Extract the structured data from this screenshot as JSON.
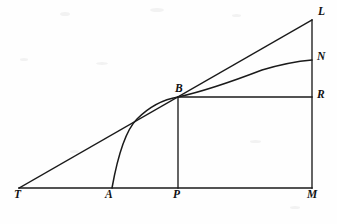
{
  "figure": {
    "kind": "geometry-diagram",
    "width": 337,
    "height": 224,
    "background_color": "#fefefe",
    "stroke_color": "#1a1a1a",
    "labels": [
      {
        "id": "label-T",
        "text": "T",
        "x": 14,
        "y": 189
      },
      {
        "id": "label-A",
        "text": "A",
        "x": 105,
        "y": 189
      },
      {
        "id": "label-P",
        "text": "P",
        "x": 173,
        "y": 189
      },
      {
        "id": "label-M",
        "text": "M",
        "x": 307,
        "y": 189
      },
      {
        "id": "label-B",
        "text": "B",
        "x": 175,
        "y": 83
      },
      {
        "id": "label-R",
        "text": "R",
        "x": 317,
        "y": 89
      },
      {
        "id": "label-N",
        "text": "N",
        "x": 317,
        "y": 51
      },
      {
        "id": "label-L",
        "text": "L",
        "x": 318,
        "y": 6
      }
    ],
    "points": {
      "T": {
        "x": 19,
        "y": 188
      },
      "A": {
        "x": 112,
        "y": 188
      },
      "P": {
        "x": 178,
        "y": 188
      },
      "M": {
        "x": 312,
        "y": 188
      },
      "B": {
        "x": 178,
        "y": 97
      },
      "R": {
        "x": 312,
        "y": 97
      },
      "N": {
        "x": 312,
        "y": 60
      },
      "L": {
        "x": 312,
        "y": 20
      }
    },
    "segments": [
      {
        "id": "baseline-TM",
        "name": "baseline-tm",
        "from": "T",
        "to": "M"
      },
      {
        "id": "tangent-TL",
        "name": "tangent-line-tl",
        "from": "T",
        "to": "L"
      },
      {
        "id": "vertical-PB",
        "name": "vertical-pb",
        "from": "P",
        "to": "B"
      },
      {
        "id": "vertical-ML",
        "name": "vertical-ml",
        "from": "M",
        "to": "L"
      },
      {
        "id": "horizontal-BR",
        "name": "horizontal-br",
        "from": "B",
        "to": "R"
      }
    ],
    "curve": {
      "id": "curve-ABN",
      "name": "logarithmic-curve-abn",
      "through": [
        "A",
        "B",
        "N"
      ],
      "path": "M 112 188 C 117 160 124 132 137 119 C 151 105 166 99 178 97 C 205 91 236 80 262 70 C 282 64 300 61 312 60"
    }
  }
}
